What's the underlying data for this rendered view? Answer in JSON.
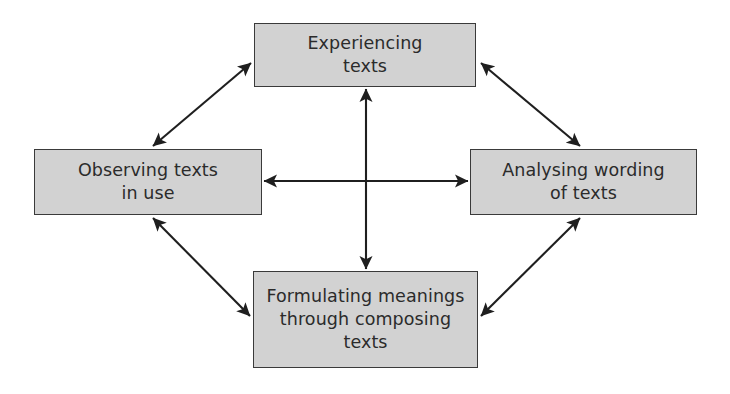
{
  "diagram": {
    "type": "cycle-diagram",
    "colors": {
      "box_fill": "#d2d2d2",
      "box_border": "#3a3a3a",
      "text": "#2b2b2b",
      "arrow": "#1f1f1f",
      "background": "#ffffff"
    },
    "nodes": [
      {
        "id": "experiencing-texts",
        "label": "Experiencing\ntexts",
        "position": "top"
      },
      {
        "id": "observing-texts",
        "label": "Observing texts\nin use",
        "position": "left"
      },
      {
        "id": "analysing-wording",
        "label": "Analysing wording\nof texts",
        "position": "right"
      },
      {
        "id": "formulating-meanings",
        "label": "Formulating meanings\nthrough composing\ntexts",
        "position": "bottom"
      }
    ],
    "connections": [
      {
        "id": "experiencing-observing",
        "from": "experiencing-texts",
        "to": "observing-texts",
        "style": "double-headed-diagonal"
      },
      {
        "id": "experiencing-analysing",
        "from": "experiencing-texts",
        "to": "analysing-wording",
        "style": "double-headed-diagonal"
      },
      {
        "id": "observing-formulating",
        "from": "observing-texts",
        "to": "formulating-meanings",
        "style": "double-headed-diagonal"
      },
      {
        "id": "analysing-formulating",
        "from": "analysing-wording",
        "to": "formulating-meanings",
        "style": "double-headed-diagonal"
      },
      {
        "id": "observing-analysing",
        "from": "observing-texts",
        "to": "analysing-wording",
        "style": "double-headed-horizontal"
      },
      {
        "id": "experiencing-formulating",
        "from": "experiencing-texts",
        "to": "formulating-meanings",
        "style": "double-headed-vertical"
      }
    ]
  }
}
